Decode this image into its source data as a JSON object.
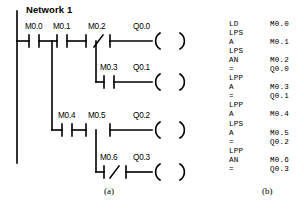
{
  "figure": {
    "network_title": "Network 1",
    "caption_ladder": "(a)",
    "caption_stl": "(b)",
    "line_color": "#000000",
    "background_color": "#ffffff"
  },
  "ladder": {
    "rungs": [
      {
        "id": "rung-1",
        "contacts": [
          {
            "name": "M0.0",
            "type": "NO"
          },
          {
            "name": "M0.1",
            "type": "NO"
          },
          {
            "name": "M0.2",
            "type": "NC"
          }
        ],
        "coil": "Q0.0"
      },
      {
        "id": "rung-2",
        "contacts": [
          {
            "name": "M0.3",
            "type": "NO"
          }
        ],
        "coil": "Q0.1"
      },
      {
        "id": "rung-3",
        "contacts": [
          {
            "name": "M0.4",
            "type": "NO"
          },
          {
            "name": "M0.5",
            "type": "NO"
          }
        ],
        "coil": "Q0.2"
      },
      {
        "id": "rung-4",
        "contacts": [
          {
            "name": "M0.6",
            "type": "NC"
          }
        ],
        "coil": "Q0.3"
      }
    ],
    "labels": {
      "m00": "M0.0",
      "m01": "M0.1",
      "m02": "M0.2",
      "m03": "M0.3",
      "m04": "M0.4",
      "m05": "M0.5",
      "m06": "M0.6",
      "q00": "Q0.0",
      "q01": "Q0.1",
      "q02": "Q0.2",
      "q03": "Q0.3"
    }
  },
  "stl": {
    "lines": [
      {
        "op": "LD",
        "operand": "M0.0"
      },
      {
        "op": "LPS",
        "operand": ""
      },
      {
        "op": "A",
        "operand": "M0.1"
      },
      {
        "op": "LPS",
        "operand": ""
      },
      {
        "op": "AN",
        "operand": "M0.2"
      },
      {
        "op": "=",
        "operand": "Q0.0"
      },
      {
        "op": "LPP",
        "operand": ""
      },
      {
        "op": "A",
        "operand": "M0.3"
      },
      {
        "op": "=",
        "operand": "Q0.1"
      },
      {
        "op": "LPP",
        "operand": ""
      },
      {
        "op": "A",
        "operand": "M0.4"
      },
      {
        "op": "LPS",
        "operand": ""
      },
      {
        "op": "A",
        "operand": "M0.5"
      },
      {
        "op": "=",
        "operand": "Q0.2"
      },
      {
        "op": "LPP",
        "operand": ""
      },
      {
        "op": "AN",
        "operand": "M0.6"
      },
      {
        "op": "=",
        "operand": "Q0.3"
      }
    ]
  }
}
